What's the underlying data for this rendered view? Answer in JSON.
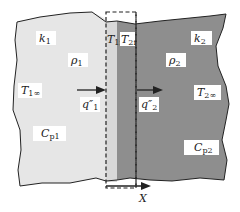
{
  "diagram": {
    "type": "two-material interface heat conduction",
    "colors": {
      "material1_fill": "#e6e6e6",
      "material2_fill": "#8e8e8e",
      "interface_strip_fill": "#d4d4d4",
      "outline": "#222222",
      "label_box": "#ffffff"
    },
    "material1": {
      "conductivity": {
        "base": "k",
        "sub": "1"
      },
      "density": {
        "base": "ρ",
        "sub": "1"
      },
      "far_temperature": {
        "base": "T",
        "sub": "1∞"
      },
      "heat_capacity": {
        "base": "C",
        "sub": "p1"
      },
      "heat_flux": {
        "base": "q″",
        "sub": "1"
      }
    },
    "material2": {
      "conductivity": {
        "base": "k",
        "sub": "2"
      },
      "density": {
        "base": "ρ",
        "sub": "2"
      },
      "far_temperature": {
        "base": "T",
        "sub": "2∞"
      },
      "heat_capacity": {
        "base": "C",
        "sub": "p2"
      },
      "heat_flux": {
        "base": "q″",
        "sub": "2"
      }
    },
    "interface": {
      "temp1": {
        "base": "T",
        "sub": "1i"
      },
      "temp2": {
        "base": "T",
        "sub": "2i"
      }
    },
    "axis": {
      "label": "X"
    }
  }
}
